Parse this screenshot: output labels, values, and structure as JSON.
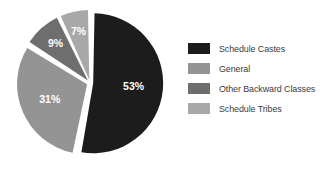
{
  "chart_data": {
    "type": "pie",
    "title": "",
    "categories": [
      "Schedule Castes",
      "General",
      "Other Backward Classes",
      "Schedule Tribes"
    ],
    "values": [
      53,
      31,
      9,
      7
    ],
    "value_labels": [
      "53%",
      "31%",
      "9%",
      "7%"
    ],
    "colors": [
      "#1c1c1c",
      "#949494",
      "#6e6e6e",
      "#a8a8a8"
    ],
    "unit": "%",
    "legend_position": "right",
    "grid": false,
    "exploded": true,
    "start_angle_deg": 0,
    "direction": "clockwise",
    "background": "#ffffff",
    "label_color": "#ffffff",
    "legend_text_color": "#3b3b3b",
    "slices": [
      {
        "label": "Schedule Castes",
        "value": 53,
        "display": "53%",
        "color": "#1c1c1c"
      },
      {
        "label": "General",
        "value": 31,
        "display": "31%",
        "color": "#949494"
      },
      {
        "label": "Other Backward Classes",
        "value": 9,
        "display": "9%",
        "color": "#6e6e6e"
      },
      {
        "label": "Schedule Tribes",
        "value": 7,
        "display": "7%",
        "color": "#a8a8a8"
      }
    ]
  },
  "legend": {
    "items": [
      {
        "label": "Schedule Castes",
        "color": "#1c1c1c"
      },
      {
        "label": "General",
        "color": "#949494"
      },
      {
        "label": "Other Backward Classes",
        "color": "#6e6e6e"
      },
      {
        "label": "Schedule Tribes",
        "color": "#a8a8a8"
      }
    ]
  }
}
